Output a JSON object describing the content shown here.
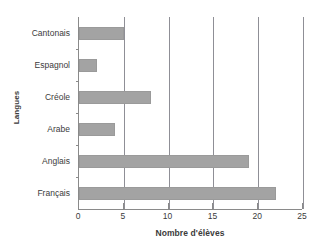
{
  "chart_data": {
    "type": "bar",
    "orientation": "horizontal",
    "title": "",
    "xlabel": "Nombre d'élèves",
    "ylabel": "Langues",
    "categories": [
      "Cantonais",
      "Espagnol",
      "Créole",
      "Arabe",
      "Anglais",
      "Français"
    ],
    "values": [
      5,
      2,
      8,
      4,
      19,
      22
    ],
    "xlim": [
      0,
      25
    ],
    "xticks": [
      0,
      5,
      10,
      15,
      20,
      25
    ],
    "xtick_labels": [
      "0",
      "5",
      "10",
      "15",
      "20",
      "25"
    ],
    "grid": "vertical",
    "legend": null,
    "bar_color": "#a3a3a3",
    "gridline_color": "#8f8f96",
    "axis_color": "#8a8a8a",
    "background_color": "#ffffff"
  }
}
